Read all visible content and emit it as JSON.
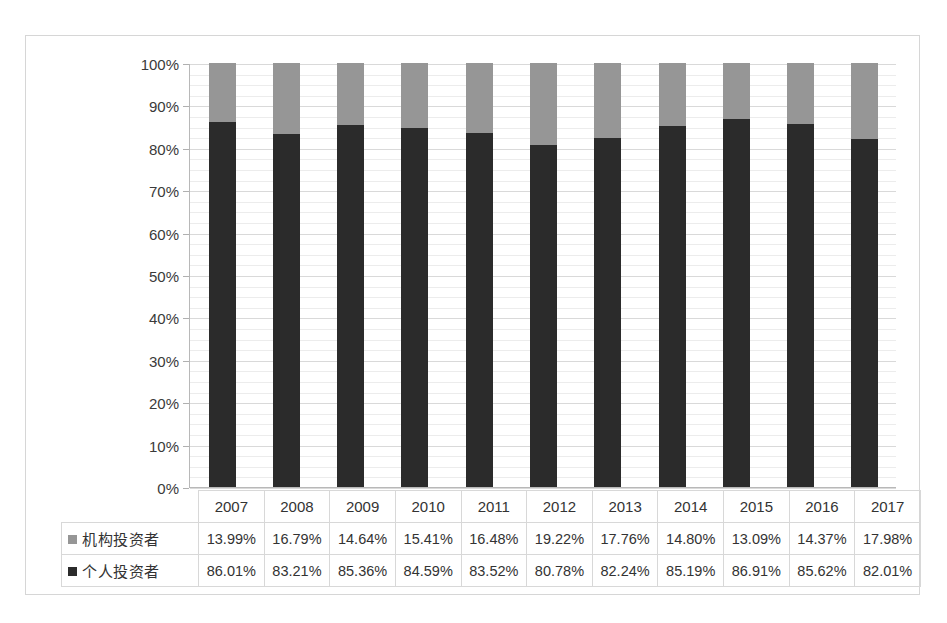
{
  "chart_data": {
    "type": "bar",
    "subtype": "stacked-100-percent",
    "title": "",
    "xlabel": "",
    "ylabel": "",
    "categories": [
      "2007",
      "2008",
      "2009",
      "2010",
      "2011",
      "2012",
      "2013",
      "2014",
      "2015",
      "2016",
      "2017"
    ],
    "series": [
      {
        "name": "机构投资者",
        "marker_color": "#969696",
        "values": [
          13.99,
          16.79,
          14.64,
          15.41,
          16.48,
          19.22,
          17.76,
          14.8,
          13.09,
          14.37,
          17.98
        ],
        "labels": [
          "13.99%",
          "16.79%",
          "14.64%",
          "15.41%",
          "16.48%",
          "19.22%",
          "17.76%",
          "14.80%",
          "13.09%",
          "14.37%",
          "17.98%"
        ]
      },
      {
        "name": "个人投资者",
        "marker_color": "#2b2b2b",
        "values": [
          86.01,
          83.21,
          85.36,
          84.59,
          83.52,
          80.78,
          82.24,
          85.19,
          86.91,
          85.62,
          82.01
        ],
        "labels": [
          "86.01%",
          "83.21%",
          "85.36%",
          "84.59%",
          "83.52%",
          "80.78%",
          "82.24%",
          "85.19%",
          "86.91%",
          "85.62%",
          "82.01%"
        ]
      }
    ],
    "ylim": [
      0,
      100
    ],
    "yticks": [
      0,
      10,
      20,
      30,
      40,
      50,
      60,
      70,
      80,
      90,
      100
    ],
    "ytick_labels": [
      "0%",
      "10%",
      "20%",
      "30%",
      "40%",
      "50%",
      "60%",
      "70%",
      "80%",
      "90%",
      "100%"
    ],
    "grid": true,
    "legend_position": "data-table-left",
    "stack_order_bottom_to_top": [
      "个人投资者",
      "机构投资者"
    ]
  },
  "table": {
    "corner_label": "",
    "year_header": [
      "2007",
      "2008",
      "2009",
      "2010",
      "2011",
      "2012",
      "2013",
      "2014",
      "2015",
      "2016",
      "2017"
    ],
    "rows": [
      {
        "legend": "机构投资者",
        "marker_color": "#969696",
        "cells": [
          "13.99%",
          "16.79%",
          "14.64%",
          "15.41%",
          "16.48%",
          "19.22%",
          "17.76%",
          "14.80%",
          "13.09%",
          "14.37%",
          "17.98%"
        ]
      },
      {
        "legend": "个人投资者",
        "marker_color": "#2b2b2b",
        "cells": [
          "86.01%",
          "83.21%",
          "85.36%",
          "84.59%",
          "83.52%",
          "80.78%",
          "82.24%",
          "85.19%",
          "86.91%",
          "85.62%",
          "82.01%"
        ]
      }
    ]
  },
  "colors": {
    "institutional": "#969696",
    "individual": "#2b2b2b",
    "gridline": "#d9d9d9",
    "frame": "#d6d6d6",
    "axis": "#b8b8b8",
    "background": "#ffffff"
  }
}
